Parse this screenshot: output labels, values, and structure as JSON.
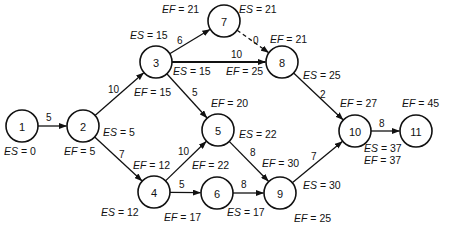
{
  "diagram": {
    "type": "activity-on-node network (CPM)",
    "nodes": [
      {
        "id": "1",
        "label": "1",
        "x": 22,
        "y": 126
      },
      {
        "id": "2",
        "label": "2",
        "x": 83,
        "y": 126
      },
      {
        "id": "3",
        "label": "3",
        "x": 156,
        "y": 62
      },
      {
        "id": "4",
        "label": "4",
        "x": 154,
        "y": 192
      },
      {
        "id": "5",
        "label": "5",
        "x": 218,
        "y": 130
      },
      {
        "id": "6",
        "label": "6",
        "x": 217,
        "y": 193
      },
      {
        "id": "7",
        "label": "7",
        "x": 224,
        "y": 21
      },
      {
        "id": "8",
        "label": "8",
        "x": 282,
        "y": 62
      },
      {
        "id": "9",
        "label": "9",
        "x": 280,
        "y": 193
      },
      {
        "id": "10",
        "label": "10",
        "x": 355,
        "y": 131
      },
      {
        "id": "11",
        "label": "11",
        "x": 416,
        "y": 131
      }
    ],
    "edges": [
      {
        "from": "1",
        "to": "2",
        "weight": "5",
        "style": "solid",
        "lx": 46,
        "ly": 121
      },
      {
        "from": "2",
        "to": "3",
        "weight": "10",
        "style": "solid",
        "lx": 108,
        "ly": 93
      },
      {
        "from": "2",
        "to": "4",
        "weight": "7",
        "style": "solid",
        "lx": 119,
        "ly": 158
      },
      {
        "from": "3",
        "to": "7",
        "weight": "6",
        "style": "solid",
        "lx": 177,
        "ly": 44
      },
      {
        "from": "3",
        "to": "8",
        "weight": "10",
        "style": "thick",
        "lx": 231,
        "ly": 58
      },
      {
        "from": "3",
        "to": "5",
        "weight": "5",
        "style": "solid",
        "lx": 192,
        "ly": 96
      },
      {
        "from": "7",
        "to": "8",
        "weight": "0",
        "style": "dashed",
        "lx": 253,
        "ly": 44
      },
      {
        "from": "4",
        "to": "5",
        "weight": "10",
        "style": "solid",
        "lx": 178,
        "ly": 155
      },
      {
        "from": "4",
        "to": "6",
        "weight": "5",
        "style": "solid",
        "lx": 179,
        "ly": 188
      },
      {
        "from": "5",
        "to": "9",
        "weight": "8",
        "style": "solid",
        "lx": 250,
        "ly": 156
      },
      {
        "from": "6",
        "to": "9",
        "weight": "8",
        "style": "solid",
        "lx": 241,
        "ly": 188
      },
      {
        "from": "8",
        "to": "10",
        "weight": "2",
        "style": "solid",
        "lx": 320,
        "ly": 98
      },
      {
        "from": "9",
        "to": "10",
        "weight": "7",
        "style": "solid",
        "lx": 311,
        "ly": 160
      },
      {
        "from": "10",
        "to": "11",
        "weight": "8",
        "style": "solid",
        "lx": 379,
        "ly": 127
      }
    ],
    "annotations": [
      {
        "kind": "ES",
        "text_var": "ES",
        "value": "0",
        "x": 4,
        "y": 155
      },
      {
        "kind": "EF",
        "text_var": "EF",
        "value": "5",
        "x": 64,
        "y": 155
      },
      {
        "kind": "ES",
        "text_var": "ES",
        "value": "5",
        "x": 103,
        "y": 136
      },
      {
        "kind": "ES",
        "text_var": "ES",
        "value": "15",
        "x": 130,
        "y": 39
      },
      {
        "kind": "EF",
        "text_var": "EF",
        "value": "15",
        "x": 134,
        "y": 96
      },
      {
        "kind": "EF",
        "text_var": "EF",
        "value": "21",
        "x": 162,
        "y": 13
      },
      {
        "kind": "ES",
        "text_var": "ES",
        "value": "21",
        "x": 239,
        "y": 13
      },
      {
        "kind": "ES",
        "text_var": "ES",
        "value": "15",
        "x": 173,
        "y": 75
      },
      {
        "kind": "EF",
        "text_var": "EF",
        "value": "25",
        "x": 226,
        "y": 75
      },
      {
        "kind": "EF",
        "text_var": "EF",
        "value": "21",
        "x": 270,
        "y": 43
      },
      {
        "kind": "ES",
        "text_var": "ES",
        "value": "25",
        "x": 303,
        "y": 79
      },
      {
        "kind": "EF",
        "text_var": "EF",
        "value": "20",
        "x": 211,
        "y": 107
      },
      {
        "kind": "ES",
        "text_var": "ES",
        "value": "22",
        "x": 239,
        "y": 138
      },
      {
        "kind": "EF",
        "text_var": "EF",
        "value": "12",
        "x": 133,
        "y": 169
      },
      {
        "kind": "EF",
        "text_var": "EF",
        "value": "22",
        "x": 192,
        "y": 169
      },
      {
        "kind": "ES",
        "text_var": "ES",
        "value": "12",
        "x": 101,
        "y": 216
      },
      {
        "kind": "EF",
        "text_var": "EF",
        "value": "17",
        "x": 164,
        "y": 221
      },
      {
        "kind": "EF",
        "text_var": "EF",
        "value": "30",
        "x": 262,
        "y": 167
      },
      {
        "kind": "ES",
        "text_var": "ES",
        "value": "17",
        "x": 227,
        "y": 216
      },
      {
        "kind": "ES",
        "text_var": "ES",
        "value": "30",
        "x": 303,
        "y": 189
      },
      {
        "kind": "EF",
        "text_var": "EF",
        "value": "25",
        "x": 294,
        "y": 222
      },
      {
        "kind": "EF",
        "text_var": "EF",
        "value": "27",
        "x": 340,
        "y": 107
      },
      {
        "kind": "EF",
        "text_var": "EF",
        "value": "45",
        "x": 402,
        "y": 107
      },
      {
        "kind": "ES",
        "text_var": "ES",
        "value": "37",
        "x": 364,
        "y": 152
      },
      {
        "kind": "EF",
        "text_var": "EF",
        "value": "37",
        "x": 364,
        "y": 164
      }
    ]
  },
  "style": {
    "stroke_color": "#111111",
    "background": "#ffffff",
    "node_radius": 16
  }
}
